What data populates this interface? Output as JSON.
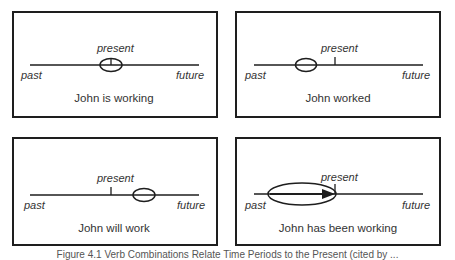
{
  "figure": {
    "caption": "Figure 4.1 Verb Combinations Relate Time Periods to the Present (cited by ..."
  },
  "labels": {
    "past": "past",
    "present": "present",
    "future": "future"
  },
  "panels": [
    {
      "id": "present-progressive",
      "sentence": "John is working",
      "marker": "ellipse-at-present"
    },
    {
      "id": "simple-past",
      "sentence": "John worked",
      "marker": "ellipse-before-present"
    },
    {
      "id": "simple-future",
      "sentence": "John will work",
      "marker": "ellipse-after-present"
    },
    {
      "id": "present-perfect-progressive",
      "sentence": "John has been working",
      "marker": "long-ellipse-with-arrow-to-present"
    }
  ],
  "colors": {
    "line": "#1e1e1e",
    "text": "#333333",
    "background": "#ffffff"
  }
}
